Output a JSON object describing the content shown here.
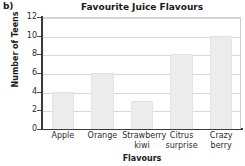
{
  "figure": {
    "part_label": "b)"
  },
  "chart_data": {
    "type": "bar",
    "title": "Favourite Juice Flavours",
    "xlabel": "Flavours",
    "ylabel": "Number of Teens",
    "categories": [
      "Apple",
      "Orange",
      "Strawberry kiwi",
      "Citrus surprise",
      "Crazy berry"
    ],
    "category_lines": [
      [
        "Apple"
      ],
      [
        "Orange"
      ],
      [
        "Strawberry",
        "kiwi"
      ],
      [
        "Citrus",
        "surprise"
      ],
      [
        "Crazy",
        "berry"
      ]
    ],
    "values": [
      4,
      6,
      3,
      8,
      10
    ],
    "ylim": [
      0,
      12
    ],
    "yticks": [
      0,
      2,
      4,
      6,
      8,
      10,
      12
    ],
    "ytick_labels": [
      "0",
      "2",
      "4",
      "6",
      "8",
      "10",
      "12"
    ],
    "grid": true,
    "grid_axis": "y",
    "legend": null,
    "bar_color": "#ececec",
    "grid_color": "#d8d8d8",
    "axis_color": "#3a3a3a"
  }
}
